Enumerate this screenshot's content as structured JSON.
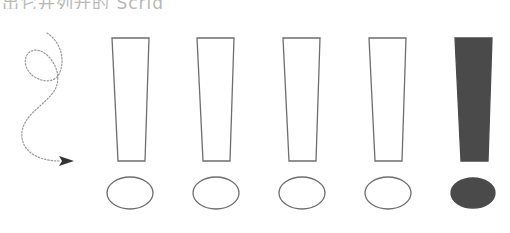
{
  "caption": {
    "text": "出它并列开的 Scrig",
    "note": "top text line is cropped; only lower portion visible"
  },
  "figure": {
    "stroke_color": "#6e6e6e",
    "fill_color": "#4a4a4a",
    "squiggle_color": "#9a9a9a",
    "arrowhead_color": "#333333",
    "exclamations": [
      {
        "id": 1,
        "filled": false,
        "top_left": 112,
        "top_right": 149,
        "bottom_left": 118,
        "bottom_right": 145,
        "dot_cx": 130,
        "dot_rx": 23
      },
      {
        "id": 2,
        "filled": false,
        "top_left": 197,
        "top_right": 234,
        "bottom_left": 203,
        "bottom_right": 230,
        "dot_cx": 216,
        "dot_rx": 23
      },
      {
        "id": 3,
        "filled": false,
        "top_left": 283,
        "top_right": 320,
        "bottom_left": 289,
        "bottom_right": 316,
        "dot_cx": 302,
        "dot_rx": 23
      },
      {
        "id": 4,
        "filled": false,
        "top_left": 369,
        "top_right": 406,
        "bottom_left": 375,
        "bottom_right": 402,
        "dot_cx": 388,
        "dot_rx": 23
      },
      {
        "id": 5,
        "filled": true,
        "top_left": 455,
        "top_right": 492,
        "bottom_left": 461,
        "bottom_right": 488,
        "dot_cx": 473,
        "dot_rx": 22
      }
    ],
    "bar_top_y": 38,
    "bar_bottom_y": 161,
    "dot_cy": 193,
    "dot_ry": 16
  }
}
